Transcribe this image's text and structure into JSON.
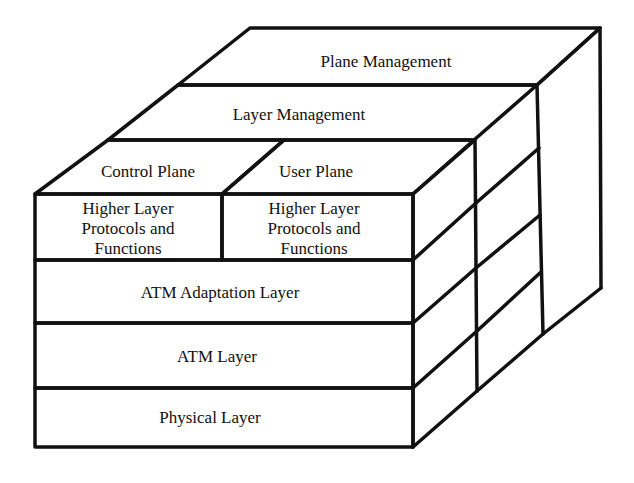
{
  "diagram": {
    "colors": {
      "stroke": "#111111",
      "fill": "#ffffff",
      "text": "#111111"
    },
    "top_faces": {
      "plane_management": "Plane Management",
      "layer_management": "Layer Management",
      "control_plane": "Control Plane",
      "user_plane": "User Plane"
    },
    "front_faces": {
      "control_higher_layer": [
        "Higher Layer",
        "Protocols and",
        "Functions"
      ],
      "user_higher_layer": [
        "Higher Layer",
        "Protocols and",
        "Functions"
      ],
      "aal": "ATM Adaptation Layer",
      "atm": "ATM Layer",
      "physical": "Physical Layer"
    }
  }
}
